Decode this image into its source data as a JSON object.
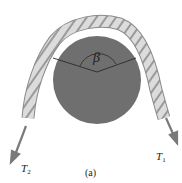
{
  "diagram": {
    "angle_label": "β",
    "tension_right": {
      "symbol": "T",
      "subscript": "1"
    },
    "tension_left": {
      "symbol": "T",
      "subscript": "2"
    },
    "caption": "(a)",
    "colors": {
      "cylinder": "#6f6f6f",
      "rope": "#d9d9d9",
      "rope_stripe": "#9a9a9a",
      "arrow": "#7a7a7a",
      "angle_lines": "#2a2a2a"
    }
  }
}
